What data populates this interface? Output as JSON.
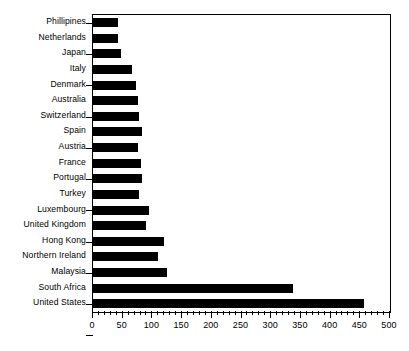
{
  "chart_data": {
    "type": "bar",
    "orientation": "horizontal",
    "title": "",
    "subtitle": "",
    "xlabel": "",
    "ylabel": "",
    "xlim": [
      0,
      500
    ],
    "ylim": null,
    "grid": false,
    "legend": null,
    "bar_color": "#000000",
    "background_color": "#ffffff",
    "axis_color": "#000000",
    "x_major_ticks": [
      0,
      50,
      100,
      150,
      200,
      250,
      300,
      350,
      400,
      450,
      500
    ],
    "x_tick_labels": [
      "0",
      "50",
      "100",
      "150",
      "200",
      "250",
      "300",
      "350",
      "400",
      "450",
      "500"
    ],
    "x_minor_tick_step": 10,
    "categories": [
      "Phillipines",
      "Netherlands",
      "Japan",
      "Italy",
      "Denmark",
      "Australia",
      "Switzerland",
      "Spain",
      "Austria",
      "France",
      "Portugal",
      "Turkey",
      "Luxembourg",
      "United Kingdom",
      "Hong Kong",
      "Northern Ireland",
      "Malaysia",
      "South Africa",
      "United States"
    ],
    "values": [
      42,
      42,
      47,
      65,
      72,
      75,
      78,
      82,
      76,
      80,
      82,
      78,
      95,
      90,
      120,
      110,
      125,
      337,
      456
    ]
  }
}
